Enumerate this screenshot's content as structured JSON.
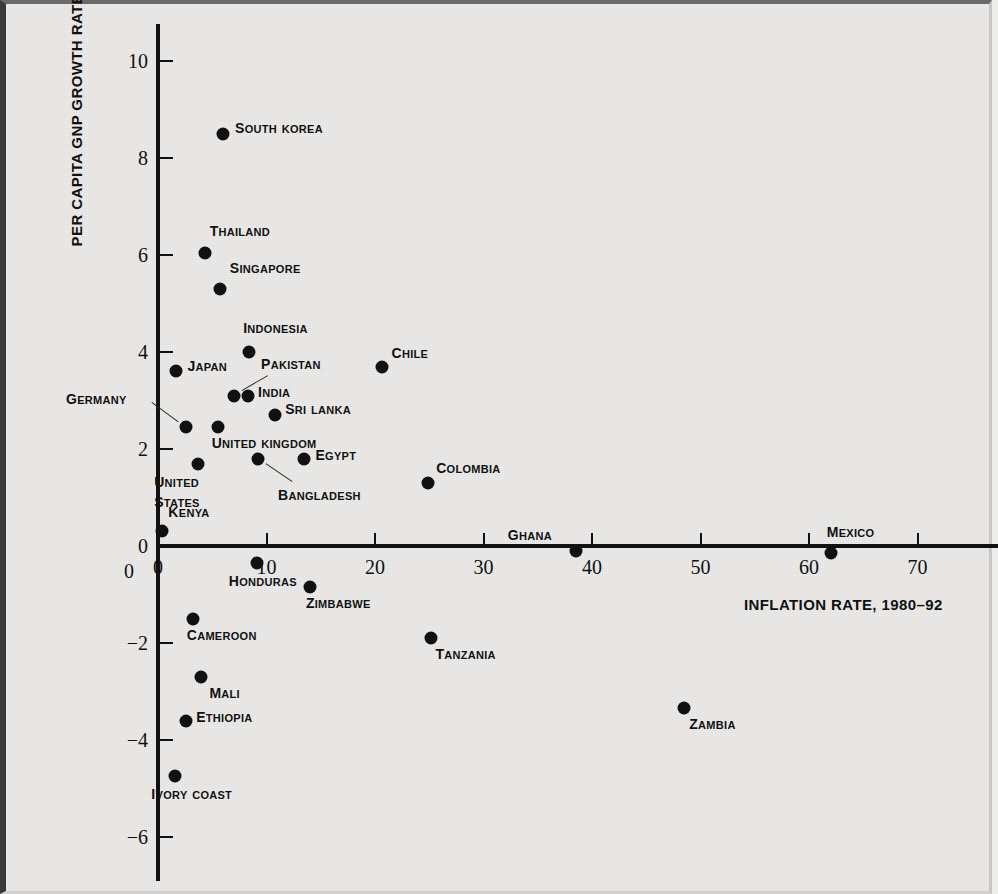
{
  "chart_data": {
    "type": "scatter",
    "title": "",
    "xlabel": "INFLATION RATE, 1980–92",
    "ylabel": "PER CAPITA GNP GROWTH RATE, 1980–92",
    "xlim": [
      -2,
      75
    ],
    "ylim": [
      -6.6,
      10.6
    ],
    "xticks": [
      0,
      10,
      20,
      30,
      40,
      50,
      60,
      70
    ],
    "yticks": [
      -6,
      -4,
      -2,
      0,
      2,
      4,
      6,
      8,
      10
    ],
    "xtick_labels": [
      "0",
      "10",
      "20",
      "30",
      "40",
      "50",
      "60",
      "70"
    ],
    "ytick_labels": [
      "-6",
      "-4",
      "-2",
      "0",
      "2",
      "4",
      "6",
      "8",
      "10"
    ],
    "grid": false,
    "legend": "none",
    "origin_label": "0",
    "points": [
      {
        "name": "South Korea",
        "x": 6.0,
        "y": 8.5,
        "label_pos": "right"
      },
      {
        "name": "Thailand",
        "x": 4.3,
        "y": 6.05,
        "label_pos": "above-right"
      },
      {
        "name": "Singapore",
        "x": 5.7,
        "y": 5.3,
        "label_pos": "above-right"
      },
      {
        "name": "Indonesia",
        "x": 8.4,
        "y": 4.0,
        "label_pos": "above"
      },
      {
        "name": "Japan",
        "x": 1.7,
        "y": 3.6,
        "label_pos": "right"
      },
      {
        "name": "Chile",
        "x": 20.6,
        "y": 3.7,
        "label_pos": "above-right"
      },
      {
        "name": "Pakistan",
        "x": 7.0,
        "y": 3.1,
        "label_pos": "leader"
      },
      {
        "name": "India",
        "x": 8.3,
        "y": 3.1,
        "label_pos": "right"
      },
      {
        "name": "Sri Lanka",
        "x": 10.8,
        "y": 2.7,
        "label_pos": "right"
      },
      {
        "name": "Germany",
        "x": 2.6,
        "y": 2.45,
        "label_pos": "leader"
      },
      {
        "name": "United Kingdom",
        "x": 5.5,
        "y": 2.45,
        "label_pos": "below-right"
      },
      {
        "name": "United States",
        "x": 3.7,
        "y": 1.7,
        "label_pos": "below"
      },
      {
        "name": "Bangladesh",
        "x": 9.2,
        "y": 1.8,
        "label_pos": "leader"
      },
      {
        "name": "Egypt",
        "x": 13.5,
        "y": 1.8,
        "label_pos": "right"
      },
      {
        "name": "Colombia",
        "x": 24.9,
        "y": 1.3,
        "label_pos": "above-right"
      },
      {
        "name": "Kenya",
        "x": 0.4,
        "y": 0.3,
        "label_pos": "above-right"
      },
      {
        "name": "Ghana",
        "x": 38.5,
        "y": -0.1,
        "label_pos": "above-left"
      },
      {
        "name": "Mexico",
        "x": 62.0,
        "y": -0.15,
        "label_pos": "above-right"
      },
      {
        "name": "Honduras",
        "x": 9.1,
        "y": -0.35,
        "label_pos": "below-left"
      },
      {
        "name": "Zimbabwe",
        "x": 14.0,
        "y": -0.85,
        "label_pos": "below-right"
      },
      {
        "name": "Cameroon",
        "x": 3.2,
        "y": -1.5,
        "label_pos": "below-right"
      },
      {
        "name": "Tanzania",
        "x": 25.2,
        "y": -1.9,
        "label_pos": "below-right"
      },
      {
        "name": "Mali",
        "x": 4.0,
        "y": -2.7,
        "label_pos": "below-right"
      },
      {
        "name": "Ethiopia",
        "x": 2.6,
        "y": -3.6,
        "label_pos": "right"
      },
      {
        "name": "Zambia",
        "x": 48.5,
        "y": -3.35,
        "label_pos": "below-right"
      },
      {
        "name": "Ivory Coast",
        "x": 1.6,
        "y": -4.75,
        "label_pos": "below-right"
      }
    ]
  },
  "colors": {
    "background": "#ecebe9",
    "ink": "#111111",
    "border": "#3a3a3a"
  }
}
